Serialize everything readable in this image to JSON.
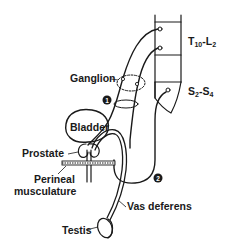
{
  "diagram": {
    "colors": {
      "ink": "#1a1a1a",
      "background": "#ffffff"
    },
    "labels": {
      "spinal_upper": {
        "main": "T",
        "sub1": "10",
        "dash": "-L",
        "sub2": "2"
      },
      "spinal_lower": {
        "main": "S",
        "sub1": "2",
        "dash": "-S",
        "sub2": "4"
      },
      "ganglion": "Ganglion",
      "bladder": "Bladder",
      "prostate": "Prostate",
      "perineal_line1": "Perineal",
      "perineal_line2": "musculature",
      "vas_deferens": "Vas deferens",
      "testis": "Testis"
    },
    "markers": [
      {
        "id": "1",
        "label": "1"
      },
      {
        "id": "2",
        "label": "2"
      }
    ]
  }
}
